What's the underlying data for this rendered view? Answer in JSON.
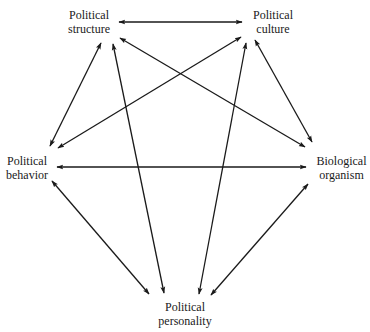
{
  "diagram": {
    "type": "fully-connected pentagon of bidirectional influences",
    "nodes": [
      {
        "id": "structure",
        "line1": "Political",
        "line2": "structure"
      },
      {
        "id": "culture",
        "line1": "Political",
        "line2": "culture"
      },
      {
        "id": "behavior",
        "line1": "Political",
        "line2": "behavior"
      },
      {
        "id": "organism",
        "line1": "Biological",
        "line2": "organism"
      },
      {
        "id": "personality",
        "line1": "Political",
        "line2": "personality"
      }
    ],
    "edges": [
      {
        "from": "structure",
        "to": "culture",
        "direction": "both"
      },
      {
        "from": "structure",
        "to": "behavior",
        "direction": "both"
      },
      {
        "from": "structure",
        "to": "organism",
        "direction": "both"
      },
      {
        "from": "structure",
        "to": "personality",
        "direction": "both"
      },
      {
        "from": "culture",
        "to": "behavior",
        "direction": "both"
      },
      {
        "from": "culture",
        "to": "organism",
        "direction": "both"
      },
      {
        "from": "culture",
        "to": "personality",
        "direction": "both"
      },
      {
        "from": "behavior",
        "to": "organism",
        "direction": "both"
      },
      {
        "from": "behavior",
        "to": "personality",
        "direction": "both"
      },
      {
        "from": "organism",
        "to": "personality",
        "direction": "both"
      }
    ],
    "colors": {
      "line": "#1a1a1a",
      "background": "#ffffff",
      "text": "#1a1a1a"
    }
  }
}
